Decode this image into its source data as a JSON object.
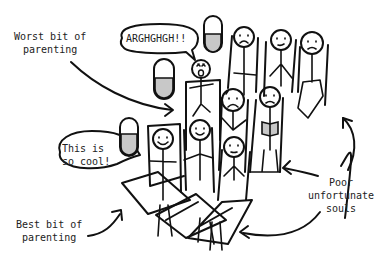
{
  "comic": {
    "labels": {
      "worst": [
        "Worst bit of",
        "parenting"
      ],
      "best": [
        "Best bit of",
        "parenting"
      ],
      "poor": [
        "Poor",
        "unfortunate",
        "souls"
      ]
    },
    "speech": {
      "scream": "ARGHGHGH!!",
      "happy": [
        "This is",
        "so cool!"
      ]
    },
    "colors": {
      "ink": "#111111",
      "fill": "#c8c8c8",
      "background": "#ffffff"
    }
  }
}
